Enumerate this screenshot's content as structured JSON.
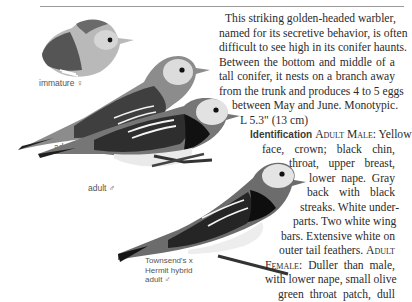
{
  "species_text": {
    "lines": [
      "This striking golden-headed warbler,",
      "named for its secretive behavior, is often",
      "difficult to see high in its conifer haunts.",
      "Between the bottom and middle of a",
      "tall conifer, it nests on a branch away",
      "from the trunk and produces 4 to 5 eggs",
      "between May and June. Monotypic.",
      "L 5.3\" (13 cm)"
    ],
    "identification_heading": "Identification",
    "adult_male_label": "Adult Male:",
    "id_lines": [
      "Yellow",
      "face, crown; black chin,",
      "throat, upper breast,",
      "lower nape. Gray",
      "back with black",
      "streaks. White under-",
      "parts. Two white wing",
      "bars. Extensive white on",
      "outer tail feathers."
    ],
    "adult_label": "Adult",
    "female_label": "Female:",
    "female_lines": [
      "Duller than male,",
      "with lower nape, small olive",
      "green throat patch, dull"
    ]
  },
  "illustrations": {
    "immature_female": "immature ♀",
    "adult_female": "adult ♀",
    "adult_male": "adult ♂",
    "hybrid_line1": "Townsend's x",
    "hybrid_line2": "Hermit hybrid",
    "hybrid_line3": "adult ♂"
  }
}
